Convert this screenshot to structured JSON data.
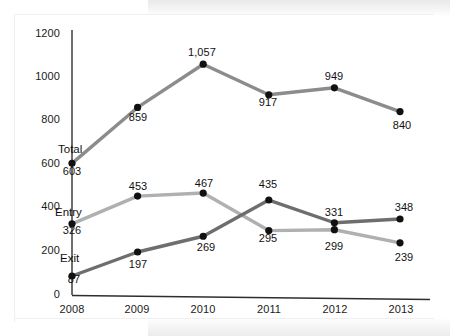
{
  "chart_data": {
    "type": "line",
    "title": "",
    "subtitle": "",
    "xlabel": "",
    "ylabel": "",
    "categories": [
      "2008",
      "2009",
      "2010",
      "2011",
      "2012",
      "2013"
    ],
    "x": [
      2008,
      2009,
      2010,
      2011,
      2012,
      2013
    ],
    "ylim": [
      0,
      1200
    ],
    "xlim": [
      "2008",
      "2013"
    ],
    "yticks": [
      "0",
      "200",
      "400",
      "600",
      "800",
      "1000",
      "1200"
    ],
    "ytick_values": [
      0,
      200,
      400,
      600,
      800,
      1000,
      1200
    ],
    "grid": false,
    "legend_position": "inline-left-labels",
    "markers": "filled-circle",
    "marker_color": "#111111",
    "series": [
      {
        "name": "Total",
        "color": "#8c8c8c",
        "values": [
          603,
          859,
          1057,
          917,
          949,
          840
        ],
        "labels": [
          "603",
          "859",
          "1,057",
          "917",
          "949",
          "840"
        ],
        "label_positions": [
          "below",
          "below",
          "above",
          "below",
          "above",
          "below"
        ]
      },
      {
        "name": "Entry",
        "color": "#b0b0b0",
        "values": [
          326,
          453,
          467,
          295,
          299,
          239
        ],
        "labels": [
          "326",
          "453",
          "467",
          "295",
          "299",
          "239"
        ],
        "label_positions": [
          "below",
          "above",
          "above",
          "below",
          "below",
          "below"
        ]
      },
      {
        "name": "Exit",
        "color": "#6e6e6e",
        "values": [
          87,
          197,
          269,
          435,
          331,
          348
        ],
        "labels": [
          "87",
          "197",
          "269",
          "435",
          "331",
          "348"
        ],
        "label_positions": [
          "below",
          "below",
          "below",
          "above",
          "above",
          "above"
        ]
      }
    ],
    "series_name_anchors": [
      {
        "name": "Total",
        "x": 58,
        "y": 143
      },
      {
        "name": "Entry",
        "x": 55,
        "y": 206
      },
      {
        "name": "Exit",
        "x": 60,
        "y": 252
      }
    ],
    "axis_color": "#4a4a4a"
  },
  "axes": {
    "y_tick_labels": [
      {
        "text": "1200",
        "px_y": 27
      },
      {
        "text": "1000",
        "px_y": 70
      },
      {
        "text": "800",
        "px_y": 113
      },
      {
        "text": "600",
        "px_y": 157
      },
      {
        "text": "400",
        "px_y": 200
      },
      {
        "text": "200",
        "px_y": 244
      },
      {
        "text": "0",
        "px_y": 288
      }
    ],
    "x_tick_labels": [
      {
        "text": "2008",
        "px_x": 49
      },
      {
        "text": "2009",
        "px_x": 114
      },
      {
        "text": "2010",
        "px_x": 180
      },
      {
        "text": "2011",
        "px_x": 246
      },
      {
        "text": "2012",
        "px_x": 312
      },
      {
        "text": "2013",
        "px_x": 378
      }
    ]
  },
  "point_labels": [
    {
      "text": "603",
      "px_x": 50,
      "px_y": 165
    },
    {
      "text": "859",
      "px_x": 116,
      "px_y": 111
    },
    {
      "text": "1,057",
      "px_x": 180,
      "px_y": 46
    },
    {
      "text": "917",
      "px_x": 246,
      "px_y": 96
    },
    {
      "text": "949",
      "px_x": 312,
      "px_y": 70
    },
    {
      "text": "840",
      "px_x": 380,
      "px_y": 119
    },
    {
      "text": "326",
      "px_x": 50,
      "px_y": 224
    },
    {
      "text": "453",
      "px_x": 116,
      "px_y": 180
    },
    {
      "text": "467",
      "px_x": 182,
      "px_y": 177
    },
    {
      "text": "295",
      "px_x": 246,
      "px_y": 232
    },
    {
      "text": "299",
      "px_x": 312,
      "px_y": 240
    },
    {
      "text": "239",
      "px_x": 382,
      "px_y": 251
    },
    {
      "text": "87",
      "px_x": 52,
      "px_y": 273
    },
    {
      "text": "197",
      "px_x": 116,
      "px_y": 258
    },
    {
      "text": "269",
      "px_x": 184,
      "px_y": 241
    },
    {
      "text": "435",
      "px_x": 246,
      "px_y": 178
    },
    {
      "text": "331",
      "px_x": 312,
      "px_y": 206
    },
    {
      "text": "348",
      "px_x": 382,
      "px_y": 201
    }
  ]
}
